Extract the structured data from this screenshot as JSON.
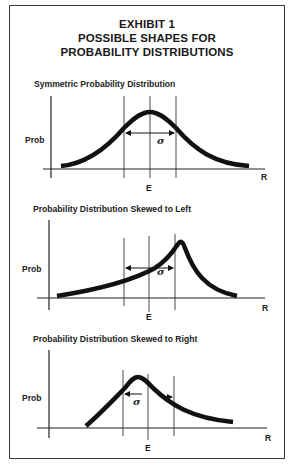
{
  "exhibit": {
    "line1": "EXHIBIT 1",
    "line2": "POSSIBLE SHAPES FOR",
    "line3": "PROBABILITY DISTRIBUTIONS"
  },
  "panels": [
    {
      "title": "Symmetric Probability Distribution",
      "y_label": "Prob",
      "x_label": "R",
      "mean_label": "E",
      "sigma_label": "σ",
      "shape": "symmetric"
    },
    {
      "title": "Probability Distribution Skewed to Left",
      "y_label": "Prob",
      "x_label": "R",
      "mean_label": "E",
      "sigma_label": "σ",
      "shape": "skewed-left"
    },
    {
      "title": "Probability Distribution Skewed to Right",
      "y_label": "Prob",
      "x_label": "R",
      "mean_label": "E",
      "sigma_label": "σ",
      "shape": "skewed-right"
    }
  ],
  "colors": {
    "ink": "#111111",
    "frame": "#3a3a3a",
    "background": "#ffffff"
  }
}
